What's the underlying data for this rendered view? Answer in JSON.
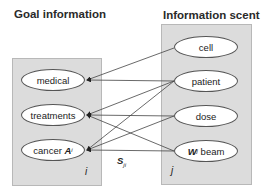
{
  "headings": {
    "goal": "Goal information",
    "scent": "Information scent"
  },
  "goal_nodes": [
    {
      "label": "medical"
    },
    {
      "label": "treatments"
    },
    {
      "label": "cancer",
      "variable": "A",
      "subscript": "i"
    }
  ],
  "scent_nodes": [
    {
      "label": "cell"
    },
    {
      "label": "patient"
    },
    {
      "label": "dose"
    },
    {
      "label": "beam",
      "variable": "W",
      "subscript": "j"
    }
  ],
  "index_labels": {
    "goal": "i",
    "scent": "j"
  },
  "strength_label": {
    "variable": "S",
    "subscript": "ji"
  },
  "edges": [
    {
      "from": "cell",
      "to": "medical"
    },
    {
      "from": "patient",
      "to": "medical"
    },
    {
      "from": "patient",
      "to": "treatments"
    },
    {
      "from": "patient",
      "to": "cancer"
    },
    {
      "from": "dose",
      "to": "treatments"
    },
    {
      "from": "dose",
      "to": "cancer"
    },
    {
      "from": "beam",
      "to": "treatments"
    },
    {
      "from": "beam",
      "to": "cancer"
    }
  ],
  "colors": {
    "box_fill": "#dcdcdc",
    "node_fill": "#ffffff",
    "line": "#444444"
  }
}
